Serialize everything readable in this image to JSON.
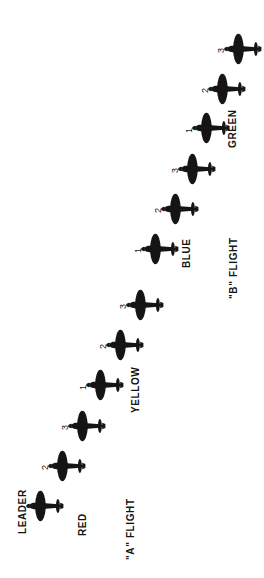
{
  "diagram": {
    "orientation": "rotated-90-ccw",
    "ink_color": "#151515",
    "background_color": "#ffffff",
    "aircraft_icon": "fighter-plan-view-silhouette",
    "flights": [
      {
        "id": "a-flight",
        "label": "\"A\" FLIGHT",
        "label_pos": {
          "x": 126,
          "y": 560
        },
        "sections": [
          {
            "id": "red",
            "label": "RED",
            "label_pos": {
              "x": 78,
              "y": 536
            },
            "aircraft": [
              {
                "id": "red-leader",
                "label": "LEADER",
                "label_style": "tag-leader",
                "plane_pos": {
                  "x": 22,
                  "y": 483
                },
                "label_pos": {
                  "x": 18,
                  "y": 534
                }
              },
              {
                "id": "red-2",
                "label": "2",
                "label_style": "tag-num",
                "plane_pos": {
                  "x": 44,
                  "y": 443
                },
                "label_pos": {
                  "x": 41,
                  "y": 470
                }
              },
              {
                "id": "red-3",
                "label": "3",
                "label_style": "tag-num",
                "plane_pos": {
                  "x": 64,
                  "y": 403
                },
                "label_pos": {
                  "x": 61,
                  "y": 430
                }
              }
            ]
          },
          {
            "id": "yellow",
            "label": "YELLOW",
            "label_pos": {
              "x": 131,
              "y": 413
            },
            "aircraft": [
              {
                "id": "yellow-1",
                "label": "1",
                "label_style": "tag-num",
                "plane_pos": {
                  "x": 82,
                  "y": 362
                },
                "label_pos": {
                  "x": 79,
                  "y": 390
                }
              },
              {
                "id": "yellow-2",
                "label": "2",
                "label_style": "tag-num",
                "plane_pos": {
                  "x": 102,
                  "y": 322
                },
                "label_pos": {
                  "x": 99,
                  "y": 349
                }
              },
              {
                "id": "yellow-3",
                "label": "3",
                "label_style": "tag-num",
                "plane_pos": {
                  "x": 122,
                  "y": 282
                },
                "label_pos": {
                  "x": 119,
                  "y": 309
                }
              }
            ]
          }
        ]
      },
      {
        "id": "b-flight",
        "label": "\"B\" FLIGHT",
        "label_pos": {
          "x": 229,
          "y": 299
        },
        "sections": [
          {
            "id": "blue",
            "label": "BLUE",
            "label_pos": {
              "x": 182,
              "y": 268
            },
            "aircraft": [
              {
                "id": "blue-1",
                "label": "1",
                "label_style": "tag-num",
                "plane_pos": {
                  "x": 137,
                  "y": 226
                },
                "label_pos": {
                  "x": 134,
                  "y": 253
                }
              },
              {
                "id": "blue-2",
                "label": "2",
                "label_style": "tag-num",
                "plane_pos": {
                  "x": 157,
                  "y": 186
                },
                "label_pos": {
                  "x": 154,
                  "y": 213
                }
              },
              {
                "id": "blue-3",
                "label": "3",
                "label_style": "tag-num",
                "plane_pos": {
                  "x": 174,
                  "y": 146
                },
                "label_pos": {
                  "x": 171,
                  "y": 173
                }
              }
            ]
          },
          {
            "id": "green",
            "label": "GREEN",
            "label_pos": {
              "x": 228,
              "y": 148
            },
            "aircraft": [
              {
                "id": "green-1",
                "label": "1",
                "label_style": "tag-num",
                "plane_pos": {
                  "x": 188,
                  "y": 105
                },
                "label_pos": {
                  "x": 185,
                  "y": 133
                }
              },
              {
                "id": "green-2",
                "label": "2",
                "label_style": "tag-num",
                "plane_pos": {
                  "x": 204,
                  "y": 66
                },
                "label_pos": {
                  "x": 201,
                  "y": 93
                }
              },
              {
                "id": "green-3",
                "label": "3",
                "label_style": "tag-num",
                "plane_pos": {
                  "x": 220,
                  "y": 26
                },
                "label_pos": {
                  "x": 217,
                  "y": 53
                }
              }
            ]
          }
        ]
      }
    ]
  }
}
